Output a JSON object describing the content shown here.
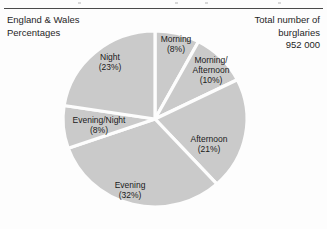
{
  "figure": {
    "caption_left": {
      "line1": "England & Wales",
      "line2": "Percentages"
    },
    "caption_right": {
      "line1": "Total number of",
      "line2": "burglaries",
      "line3": "952 000"
    }
  },
  "chart_data": {
    "type": "pie",
    "title": "England & Wales Percentages",
    "subtitle": "Total number of burglaries 952 000",
    "total_label": "952 000",
    "total_value": 952000,
    "unit": "percent",
    "start_angle_deg": 0,
    "direction": "clockwise",
    "legend": "none",
    "labels_inside_slices": true,
    "categories": [
      "Morning",
      "Morning/Afternoon",
      "Afternoon",
      "Evening",
      "Evening/Night",
      "Night"
    ],
    "values": [
      8,
      10,
      21,
      32,
      8,
      23
    ],
    "slices": [
      {
        "name": "Morning",
        "value": 8,
        "label_line1": "Morning",
        "label_line2": "(8%)",
        "label_x": 176,
        "label_y": 44
      },
      {
        "name": "Morning/Afternoon",
        "value": 10,
        "label_line1": "Morning/",
        "label_line2": "Afternoon",
        "label_line3": "(10%)",
        "label_x": 211,
        "label_y": 70
      },
      {
        "name": "Afternoon",
        "value": 21,
        "label_line1": "Afternoon",
        "label_line2": "(21%)",
        "label_x": 209,
        "label_y": 144
      },
      {
        "name": "Evening",
        "value": 32,
        "label_line1": "Evening",
        "label_line2": "(32%)",
        "label_x": 130,
        "label_y": 190
      },
      {
        "name": "Evening/Night",
        "value": 8,
        "label_line1": "Evening/Night",
        "label_line2": "(8%)",
        "label_x": 99,
        "label_y": 125
      },
      {
        "name": "Night",
        "value": 23,
        "label_line1": "Night",
        "label_line2": "(23%)",
        "label_x": 110,
        "label_y": 62
      }
    ],
    "geometry": {
      "center_x": 155,
      "center_y": 119,
      "radius_x": 92,
      "radius_y": 88
    },
    "colors": {
      "slice_fill": "#cacaca",
      "slice_gap": "#fdfdfd",
      "rule": "#4a4a4a",
      "text": "#1a1a1a"
    }
  }
}
